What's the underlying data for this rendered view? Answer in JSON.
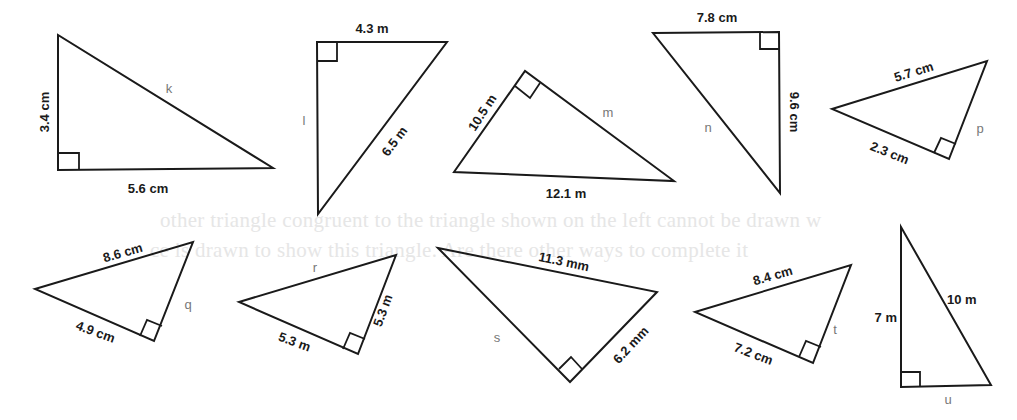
{
  "background_ghost_text": {
    "line1": "other triangle congruent to the triangle shown on the left cannot be drawn w",
    "line2": "ce is drawn to show this triangle. Are there other ways to complete it"
  },
  "triangles": [
    {
      "id": "k",
      "unknown": "k",
      "sides": [
        "3.4 cm",
        "5.6 cm"
      ],
      "unknown_side": "hypotenuse"
    },
    {
      "id": "l",
      "unknown": "l",
      "sides": [
        "4.3 m",
        "6.5 m"
      ],
      "unknown_side": "leg"
    },
    {
      "id": "m",
      "unknown": "m",
      "sides": [
        "10.5 m",
        "12.1 m"
      ],
      "unknown_side": "leg"
    },
    {
      "id": "n",
      "unknown": "n",
      "sides": [
        "7.8 cm",
        "9.6 cm"
      ],
      "unknown_side": "hypotenuse"
    },
    {
      "id": "p",
      "unknown": "p",
      "sides": [
        "5.7 cm",
        "2.3 cm"
      ],
      "unknown_side": "leg"
    },
    {
      "id": "q",
      "unknown": "q",
      "sides": [
        "8.6 cm",
        "4.9 cm"
      ],
      "unknown_side": "leg"
    },
    {
      "id": "r",
      "unknown": "r",
      "sides": [
        "5.3 m",
        "5.3 m"
      ],
      "unknown_side": "hypotenuse"
    },
    {
      "id": "s",
      "unknown": "s",
      "sides": [
        "11.3 mm",
        "6.2 mm"
      ],
      "unknown_side": "leg"
    },
    {
      "id": "t",
      "unknown": "t",
      "sides": [
        "8.4 cm",
        "7.2 cm"
      ],
      "unknown_side": "leg"
    },
    {
      "id": "u",
      "unknown": "u",
      "sides": [
        "7 m",
        "10 m"
      ],
      "unknown_side": "leg"
    }
  ]
}
